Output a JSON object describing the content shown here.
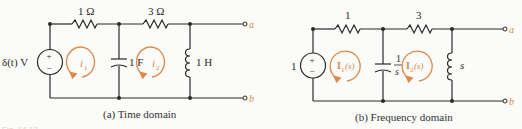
{
  "figure": {
    "caption_partial": "Fig. 14.13",
    "panel_a": {
      "caption": "(a) Time domain",
      "source": "δ(t) V",
      "source_plus": "+",
      "source_minus": "−",
      "r1": "1 Ω",
      "r2": "3 Ω",
      "capacitor": "1 F",
      "inductor": "1 H",
      "loop1": "i",
      "loop1_sub": "1",
      "loop2": "i",
      "loop2_sub": "2",
      "terminal_a": "a",
      "terminal_b": "b"
    },
    "panel_b": {
      "caption": "(b) Frequency domain",
      "source": "1",
      "source_plus": "+",
      "source_minus": "−",
      "r1": "1",
      "r2": "3",
      "capacitor_num": "1",
      "capacitor_den": "s",
      "inductor": "s",
      "loop1": "I",
      "loop1_sub": "1",
      "loop1_arg": "(s)",
      "loop2": "I",
      "loop2_sub": "2",
      "loop2_arg": "(s)",
      "terminal_a": "a",
      "terminal_b": "b"
    },
    "colors": {
      "wire": "#2a2a2a",
      "loop_arrow": "#e08a48",
      "background": "#fbfbf9"
    }
  }
}
